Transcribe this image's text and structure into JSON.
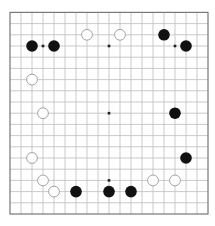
{
  "board": {
    "size": 19,
    "origin_x": 10,
    "origin_y": 12.4,
    "spacing_x": 11,
    "spacing_y": 11.2,
    "stone_radius": 5.8,
    "colors": {
      "background": "#ffffff",
      "grid_line": "#bdbdbd",
      "border": "#777777",
      "star_point": "#222222",
      "black_stone": "#111111",
      "white_stone_fill": "#ffffff",
      "white_stone_stroke": "#9a9a9a"
    },
    "star_points": [
      [
        4,
        4
      ],
      [
        10,
        4
      ],
      [
        16,
        4
      ],
      [
        4,
        10
      ],
      [
        10,
        10
      ],
      [
        16,
        10
      ],
      [
        4,
        16
      ],
      [
        10,
        16
      ],
      [
        16,
        16
      ]
    ],
    "stones": {
      "black": [
        [
          3,
          4
        ],
        [
          5,
          4
        ],
        [
          15,
          3
        ],
        [
          17,
          4
        ],
        [
          16,
          10
        ],
        [
          17,
          14
        ],
        [
          7,
          17
        ],
        [
          10,
          17
        ],
        [
          12,
          17
        ]
      ],
      "white": [
        [
          8,
          3
        ],
        [
          11,
          3
        ],
        [
          3,
          7
        ],
        [
          4,
          10
        ],
        [
          3,
          14
        ],
        [
          4,
          16
        ],
        [
          5,
          17
        ],
        [
          14,
          16
        ],
        [
          16,
          16
        ]
      ]
    }
  }
}
